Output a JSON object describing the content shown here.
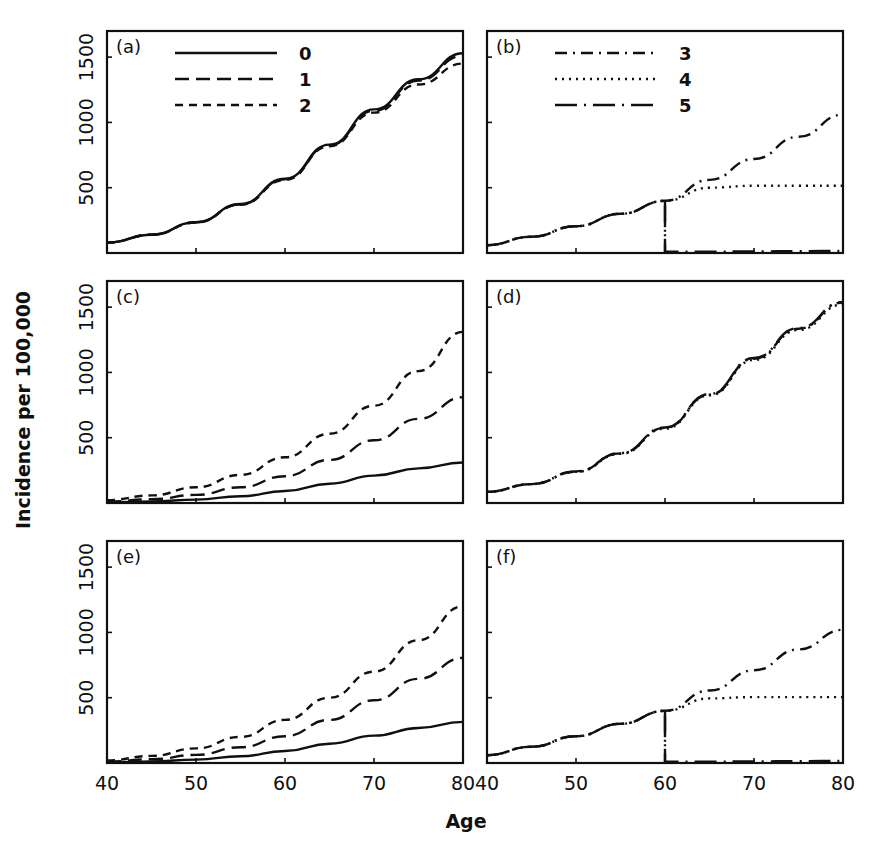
{
  "figure": {
    "xlabel": "Age",
    "ylabel": "Incidence per 100,000",
    "background": "#ffffff",
    "ink": "#101010"
  },
  "axes": {
    "x": {
      "label": "Age",
      "min": 40,
      "max": 80,
      "ticks": [
        40,
        50,
        60,
        70,
        80
      ],
      "tick_labels": [
        "40",
        "50",
        "60",
        "70",
        "80"
      ]
    },
    "y": {
      "label": "Incidence per 100,000",
      "min": 0,
      "max": 1700,
      "ticks": [
        500,
        1000,
        1500
      ],
      "tick_labels": [
        "500",
        "1000",
        "1500"
      ]
    }
  },
  "legends": [
    {
      "panel": "a",
      "entries": [
        {
          "label": "0",
          "dash": "none"
        },
        {
          "label": "1",
          "dash": "14,7"
        },
        {
          "label": "2",
          "dash": "8,6"
        }
      ]
    },
    {
      "panel": "b",
      "entries": [
        {
          "label": "3",
          "dash": "12,6,2,6"
        },
        {
          "label": "4",
          "dash": "2,5"
        },
        {
          "label": "5",
          "dash": "22,7,2,7"
        }
      ]
    }
  ],
  "chart_data": {
    "type": "line",
    "title": "",
    "xlabel": "Age",
    "ylabel": "Incidence per 100,000",
    "xlim": [
      40,
      80
    ],
    "ylim": [
      0,
      1700
    ],
    "grid": false,
    "legend_position": "top-left inside panels (a) and (b)",
    "x": [
      40,
      45,
      50,
      55,
      60,
      65,
      70,
      75,
      80
    ],
    "panels": [
      {
        "tag": "(a)",
        "legend_ref": "a",
        "series": [
          {
            "name": "0",
            "dash": "none",
            "values": [
              80,
              140,
              235,
              375,
              570,
              830,
              1100,
              1330,
              1530
            ]
          },
          {
            "name": "1",
            "dash": "14,7",
            "values": [
              80,
              140,
              235,
              372,
              565,
              825,
              1090,
              1320,
              1510
            ]
          },
          {
            "name": "2",
            "dash": "8,6",
            "values": [
              80,
              140,
              233,
              370,
              560,
              818,
              1075,
              1290,
              1450
            ]
          }
        ]
      },
      {
        "tag": "(b)",
        "legend_ref": "b",
        "series": [
          {
            "name": "3",
            "dash": "12,6,2,6",
            "values": [
              60,
              125,
              205,
              300,
              400,
              560,
              720,
              890,
              1060
            ]
          },
          {
            "name": "4",
            "dash": "2,5",
            "values": [
              60,
              125,
              205,
              300,
              400,
              500,
              515,
              515,
              515
            ]
          },
          {
            "name": "5",
            "dash": "22,7,2,7",
            "values": [
              60,
              125,
              205,
              300,
              400,
              10,
              12,
              14,
              16
            ]
          }
        ]
      },
      {
        "tag": "(c)",
        "legend_ref": "a",
        "series": [
          {
            "name": "0",
            "dash": "none",
            "values": [
              5,
              12,
              26,
              52,
              92,
              148,
              210,
              265,
              310
            ]
          },
          {
            "name": "1",
            "dash": "14,7",
            "values": [
              10,
              28,
              62,
              120,
              205,
              330,
              480,
              645,
              810
            ]
          },
          {
            "name": "2",
            "dash": "8,6",
            "values": [
              22,
              58,
              120,
              215,
              350,
              530,
              745,
              1010,
              1310
            ]
          }
        ]
      },
      {
        "tag": "(d)",
        "legend_ref": "b",
        "series": [
          {
            "name": "3",
            "dash": "12,6,2,6",
            "values": [
              85,
              145,
              240,
              380,
              575,
              830,
              1105,
              1335,
              1535
            ]
          },
          {
            "name": "4",
            "dash": "2,5",
            "values": [
              85,
              145,
              238,
              376,
              570,
              825,
              1095,
              1325,
              1520
            ]
          },
          {
            "name": "5",
            "dash": "22,7,2,7",
            "values": [
              85,
              145,
              242,
              382,
              578,
              835,
              1110,
              1340,
              1540
            ]
          }
        ]
      },
      {
        "tag": "(e)",
        "legend_ref": "a",
        "series": [
          {
            "name": "0",
            "dash": "none",
            "values": [
              5,
              12,
              26,
              52,
              92,
              148,
              210,
              268,
              315
            ]
          },
          {
            "name": "1",
            "dash": "14,7",
            "values": [
              10,
              28,
              62,
              120,
              205,
              330,
              480,
              645,
              805
            ]
          },
          {
            "name": "2",
            "dash": "8,6",
            "values": [
              20,
              54,
              112,
              200,
              330,
              500,
              700,
              940,
              1200
            ]
          }
        ]
      },
      {
        "tag": "(f)",
        "legend_ref": "b",
        "series": [
          {
            "name": "3",
            "dash": "12,6,2,6",
            "values": [
              60,
              125,
              205,
              300,
              400,
              555,
              710,
              870,
              1020
            ]
          },
          {
            "name": "4",
            "dash": "2,5",
            "values": [
              60,
              125,
              205,
              300,
              400,
              495,
              505,
              505,
              505
            ]
          },
          {
            "name": "5",
            "dash": "22,7,2,7",
            "values": [
              60,
              125,
              205,
              300,
              400,
              10,
              12,
              14,
              16
            ]
          }
        ]
      }
    ],
    "notes": [
      "Panels (b) and (f): series 3, 4 and 5 coincide up to age 60; series 5 then drops abruptly to near zero, series 4 plateaus near 500, series 3 continues rising.",
      "Panel (a) and (d): all three series nearly coincide on one exponential rise.",
      "Panels (c) and (e): the three series fan out, solid lowest, short-dash highest."
    ]
  }
}
